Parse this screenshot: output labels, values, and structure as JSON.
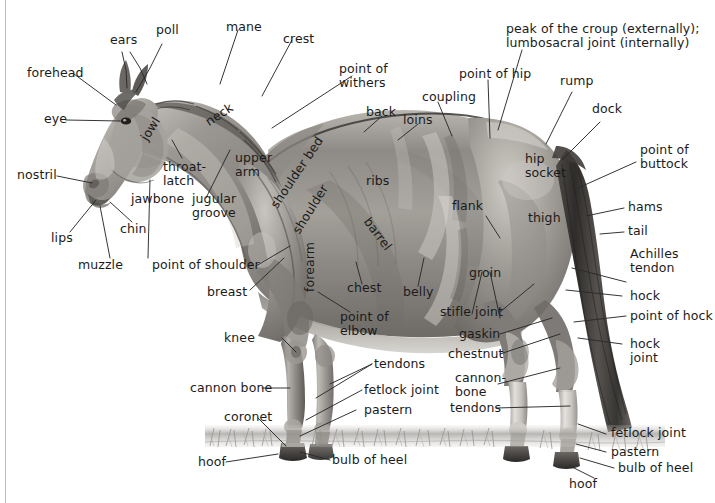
{
  "diagram": {
    "view": "left side profile, standing on grass",
    "background_color": "#ffffff",
    "text_color": "#1b1b1b",
    "leader_line_color": "#2a2a2a",
    "rule_color": "#b9bcbe"
  },
  "labels": {
    "ears": "ears",
    "poll": "poll",
    "mane": "mane",
    "crest": "crest",
    "forehead": "forehead",
    "eye": "eye",
    "nostril": "nostril",
    "lips": "lips",
    "muzzle": "muzzle",
    "chin": "chin",
    "jawbone": "jawbone",
    "jowl": "jowl",
    "throatlatch": "throat-\nlatch",
    "jugular_groove": "jugular\ngroove",
    "neck": "neck",
    "point_of_withers": "point of\nwithers",
    "back": "back",
    "loins": "loins",
    "coupling": "coupling",
    "point_of_hip": "point of hip",
    "peak_of_croup": "peak of the croup (externally);\nlumbosacral joint (internally)",
    "rump": "rump",
    "dock": "dock",
    "point_of_buttock": "point of\nbuttock",
    "hip_socket": "hip\nsocket",
    "hams": "hams",
    "tail": "tail",
    "thigh": "thigh",
    "achilles_tendon": "Achilles\ntendon",
    "hock": "hock",
    "point_of_hock": "point of hock",
    "hock_joint": "hock\njoint",
    "ribs": "ribs",
    "flank": "flank",
    "barrel": "barrel",
    "belly": "belly",
    "groin": "groin",
    "stifle_joint": "stifle joint",
    "gaskin": "gaskin",
    "chestnut": "chestnut",
    "cannon_bone_hind": "cannon-\nbone",
    "tendons_hind": "tendons",
    "fetlock_joint_hind": "fetlock joint",
    "pastern_hind": "pastern",
    "bulb_of_heel_hind": "bulb of heel",
    "hoof_hind": "hoof",
    "shoulder_bed": "shoulder bed",
    "shoulder": "shoulder",
    "upper_arm": "upper\narm",
    "point_of_shoulder": "point of shoulder",
    "breast": "breast",
    "chest": "chest",
    "point_of_elbow": "point of\nelbow",
    "forearm": "forearm",
    "knee": "knee",
    "cannon_bone_fore": "cannon bone",
    "tendons_fore": "tendons",
    "fetlock_joint_fore": "fetlock joint",
    "pastern_fore": "pastern",
    "coronet": "coronet",
    "bulb_of_heel_fore": "bulb of heel",
    "hoof_fore": "hoof"
  },
  "label_count": 62,
  "regions": {
    "head": [
      "ears",
      "poll",
      "forehead",
      "eye",
      "nostril",
      "lips",
      "muzzle",
      "chin",
      "jawbone",
      "jowl",
      "throat-latch"
    ],
    "neck": [
      "mane",
      "crest",
      "neck",
      "jugular groove"
    ],
    "forequarter": [
      "point of withers",
      "shoulder bed",
      "shoulder",
      "upper arm",
      "point of shoulder",
      "breast",
      "chest",
      "point of elbow",
      "forearm",
      "knee",
      "cannon bone",
      "tendons",
      "fetlock joint",
      "pastern",
      "coronet",
      "bulb of heel",
      "hoof"
    ],
    "body": [
      "back",
      "loins",
      "coupling",
      "ribs",
      "barrel",
      "belly",
      "flank"
    ],
    "hindquarter": [
      "point of hip",
      "peak of the croup (externally); lumbosacral joint (internally)",
      "rump",
      "dock",
      "point of buttock",
      "hip socket",
      "hams",
      "tail",
      "thigh",
      "groin",
      "stifle joint",
      "gaskin",
      "chestnut",
      "Achilles tendon",
      "hock",
      "point of hock",
      "hock joint",
      "cannon bone",
      "tendons",
      "fetlock joint",
      "pastern",
      "bulb of heel",
      "hoof"
    ]
  }
}
